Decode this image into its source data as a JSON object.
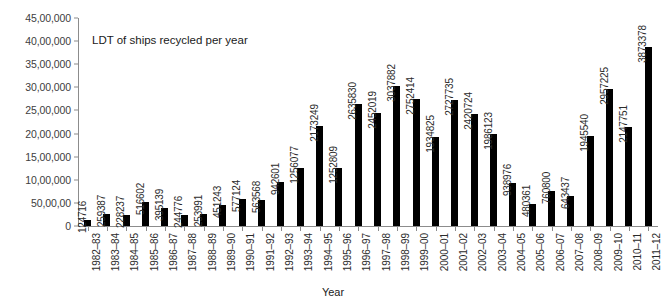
{
  "chart_data": {
    "type": "bar",
    "title": "",
    "annotation": "LDT of ships recycled per year",
    "xlabel": "Year",
    "ylabel": "",
    "ylim": [
      0,
      4500000
    ],
    "grid": false,
    "legend": "none",
    "bar_color": "#000000",
    "axis_color": "#8c8c8c",
    "y_ticks": [
      "0",
      "50,00,00",
      "10,00,000",
      "15,00,000",
      "20,00,000",
      "25,00,000",
      "30,00,000",
      "35,00,000",
      "40,00,000",
      "45,00,000"
    ],
    "y_tick_values": [
      0,
      500000,
      1000000,
      1500000,
      2000000,
      2500000,
      3000000,
      3500000,
      4000000,
      4500000
    ],
    "categories": [
      "1982–83",
      "1983–84",
      "1984–85",
      "1985–86",
      "1986–87",
      "1987–88",
      "1988–89",
      "1989–90",
      "1990–91",
      "1991–92",
      "1992–93",
      "1993–94",
      "1994–95",
      "1995–96",
      "1996–97",
      "1997–98",
      "1998–99",
      "1999–00",
      "2000–01",
      "2001–02",
      "2002–03",
      "2003–04",
      "2004–05",
      "2005–06",
      "2006–07",
      "2007–08",
      "2008–09",
      "2009–10",
      "2010–11",
      "2011–12"
    ],
    "values": [
      124716,
      259387,
      228237,
      516602,
      395139,
      244776,
      253991,
      451243,
      577124,
      563568,
      942601,
      1256077,
      2173249,
      1252809,
      2635830,
      2452019,
      3037882,
      2752414,
      1934825,
      2727735,
      2420724,
      1986123,
      938976,
      480361,
      760800,
      643437,
      1945540,
      2957225,
      2147751,
      3873378
    ],
    "data_labels": [
      "124716",
      "259387",
      "228237",
      "516602",
      "395139",
      "244776",
      "253991",
      "451243",
      "577124",
      "563568",
      "942601",
      "1256077",
      "2173249",
      "1252809",
      "2635830",
      "2452019",
      "3037882",
      "2752414",
      "1934825",
      "2727735",
      "2420724",
      "1986123",
      "938976",
      "480361",
      "760800",
      "643437",
      "1945540",
      "2957225",
      "2147751",
      "3873378"
    ]
  }
}
